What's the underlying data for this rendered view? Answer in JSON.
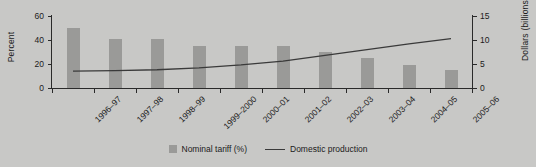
{
  "chart_data": {
    "type": "bar",
    "title": "",
    "xlabel": "",
    "categories": [
      "1996–97",
      "1997–98",
      "1998–99",
      "1999–2000",
      "2000–01",
      "2001–02",
      "2002–03",
      "2003–04",
      "2004–05",
      "2005–06"
    ],
    "series": [
      {
        "name": "Nominal tariff (%)",
        "type": "bar",
        "axis": "left",
        "values": [
          50,
          41,
          41,
          35,
          35,
          35,
          30,
          25,
          19,
          15
        ],
        "color": "#9a9a98"
      },
      {
        "name": "Domestic production",
        "type": "line",
        "axis": "right",
        "values": [
          3.5,
          3.6,
          3.8,
          4.2,
          4.8,
          5.6,
          6.8,
          8.0,
          9.2,
          10.3
        ],
        "color": "#3a3a3a"
      }
    ],
    "left_axis": {
      "label": "Percent",
      "ticks": [
        "0",
        "20",
        "40",
        "60"
      ],
      "ylim": [
        0,
        60
      ]
    },
    "right_axis": {
      "label": "Dollars (billions)",
      "ticks": [
        "0",
        "5",
        "10",
        "15"
      ],
      "ylim": [
        0,
        15
      ]
    },
    "grid": false,
    "legend_position": "bottom"
  },
  "legend": {
    "bar_label": "Nominal tariff (%)",
    "line_label": "Domestic production"
  }
}
